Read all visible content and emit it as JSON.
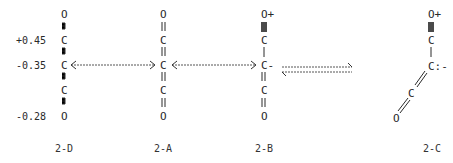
{
  "diagram": {
    "charge_labels": [
      "+0.45",
      "-0.35",
      "-0.28"
    ],
    "structures": {
      "d": {
        "caption": "2-D",
        "atoms": [
          "O",
          "C",
          "C",
          "C",
          "O"
        ]
      },
      "a": {
        "caption": "2-A",
        "atoms": [
          "O",
          "C",
          "C",
          "C",
          "O"
        ]
      },
      "b": {
        "caption": "2-B",
        "atoms": [
          "O+",
          "C",
          "C-",
          "C",
          "O"
        ]
      },
      "c": {
        "caption": "2-C",
        "atoms": [
          "O+",
          "C",
          "C:-",
          "C",
          "O"
        ]
      }
    },
    "arrows": {
      "resonance_d_a": "resonance (double-headed)",
      "resonance_a_b": "resonance (double-headed)",
      "equilibrium_b_c": "equilibrium"
    },
    "colors": {
      "ink": "#2a2a2a",
      "background": "#ffffff"
    }
  }
}
